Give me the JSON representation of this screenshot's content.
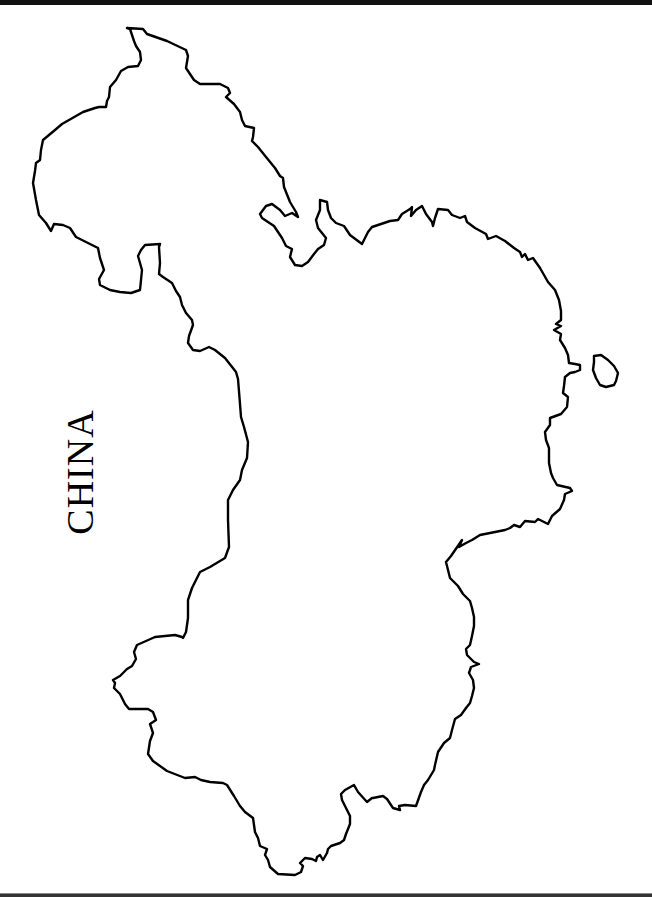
{
  "map": {
    "country_label": "CHINA",
    "outline_color": "#000000",
    "background": "#ffffff",
    "features": [
      "mainland-outline",
      "island-taiwan"
    ]
  }
}
